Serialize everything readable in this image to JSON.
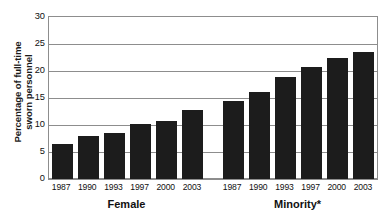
{
  "chart_data": {
    "type": "bar",
    "title": "",
    "xlabel": "",
    "ylabel": "Percentage of full-time sworn personnel",
    "ylabel_line1": "Percentage of full-time",
    "ylabel_line2": "sworn personnel",
    "ylim": [
      0,
      30
    ],
    "yticks": [
      0,
      5,
      10,
      15,
      20,
      25,
      30
    ],
    "grid": true,
    "legend": "none",
    "categories": [
      "1987",
      "1990",
      "1993",
      "1997",
      "2000",
      "2003"
    ],
    "groups": [
      {
        "name": "Female",
        "label": "Female",
        "categories": [
          "1987",
          "1990",
          "1993",
          "1997",
          "2000",
          "2003"
        ],
        "values": [
          6.5,
          8.0,
          8.5,
          10.1,
          10.7,
          12.7
        ]
      },
      {
        "name": "Minority",
        "label": "Minority*",
        "categories": [
          "1987",
          "1990",
          "1993",
          "1997",
          "2000",
          "2003"
        ],
        "values": [
          14.4,
          16.1,
          18.9,
          20.8,
          22.4,
          23.5
        ]
      }
    ],
    "series": [
      {
        "name": "Female",
        "values": [
          6.5,
          8.0,
          8.5,
          10.1,
          10.7,
          12.7
        ]
      },
      {
        "name": "Minority*",
        "values": [
          14.4,
          16.1,
          18.9,
          20.8,
          22.4,
          23.5
        ]
      }
    ],
    "bar_color": "#1c1c1c",
    "axis_color": "#8d8d8d",
    "background": "#ffffff"
  }
}
